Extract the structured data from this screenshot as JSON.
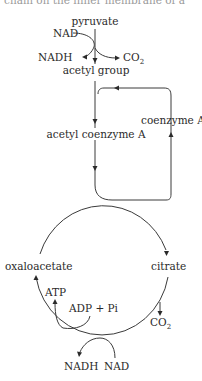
{
  "header": {
    "cut_off_text": "chain on the inner membrane of a"
  },
  "link_reaction": {
    "input": "pyruvate",
    "cofactor_in": "NAD",
    "cofactor_out": "NADH",
    "byproduct": "CO",
    "byproduct_subscript": "2",
    "product": "acetyl group"
  },
  "coenzyme_loop": {
    "combined": "acetyl coenzyme A",
    "recycled": "coenzyme A"
  },
  "krebs_cycle": {
    "left_compound": "oxaloacetate",
    "right_compound": "citrate",
    "atp_out": "ATP",
    "atp_in": "ADP + Pi",
    "co2": "CO",
    "co2_subscript": "2",
    "nadh_out": "NADH",
    "nad_in": "NAD"
  },
  "colors": {
    "line": "#3a3a3a",
    "text": "#2a2a2a",
    "background": "#ffffff"
  }
}
